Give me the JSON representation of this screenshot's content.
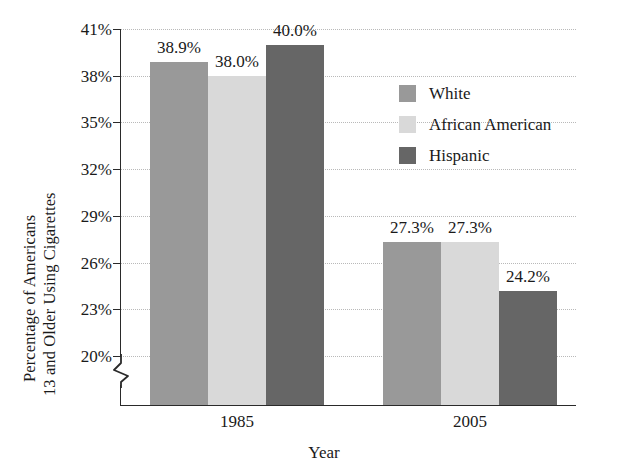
{
  "chart_data": {
    "type": "bar",
    "title": "",
    "xlabel": "Year",
    "ylabel_line1": "Percentage of Americans",
    "ylabel_line2": "13 and Older Using Cigarettes",
    "categories": [
      "1985",
      "2005"
    ],
    "series": [
      {
        "name": "White",
        "color": "#999999",
        "values": [
          38.9,
          27.3
        ]
      },
      {
        "name": "African American",
        "color": "#d9d9d9",
        "values": [
          38.0,
          27.3
        ]
      },
      {
        "name": "Hispanic",
        "color": "#666666",
        "values": [
          40.0,
          24.2
        ]
      }
    ],
    "value_labels": [
      [
        "38.9%",
        "38.0%",
        "40.0%"
      ],
      [
        "27.3%",
        "27.3%",
        "24.2%"
      ]
    ],
    "ytick_labels": [
      "41%",
      "38%",
      "35%",
      "32%",
      "29%",
      "26%",
      "23%",
      "20%"
    ],
    "ytick_values": [
      41,
      38,
      35,
      32,
      29,
      26,
      23,
      20
    ],
    "ylim": [
      20,
      41
    ],
    "axis_break": true,
    "grid": "horizontal-dotted",
    "legend_position": "inside-right"
  },
  "legend": {
    "items": [
      {
        "label": "White",
        "swatch": "#999999"
      },
      {
        "label": "African American",
        "swatch": "#d9d9d9"
      },
      {
        "label": "Hispanic",
        "swatch": "#666666"
      }
    ]
  }
}
